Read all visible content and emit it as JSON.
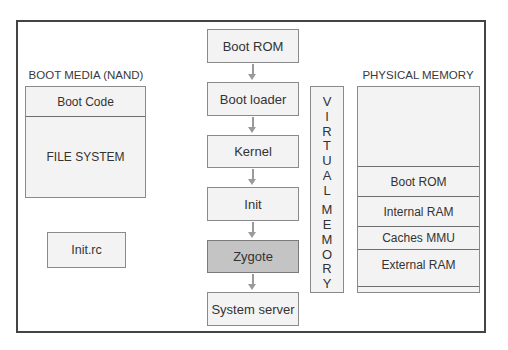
{
  "diagram": {
    "boot_media": {
      "title": "BOOT MEDIA (NAND)",
      "sections": [
        "Boot Code",
        "FILE SYSTEM"
      ]
    },
    "init_rc": {
      "label": "Init.rc"
    },
    "boot_sequence": {
      "steps": [
        "Boot ROM",
        "Boot loader",
        "Kernel",
        "Init",
        "Zygote",
        "System server"
      ],
      "highlighted_step": "Zygote"
    },
    "virtual_memory": {
      "letters_1": [
        "V",
        "I",
        "R",
        "T",
        "U",
        "A",
        "L"
      ],
      "letters_2": [
        "M",
        "E",
        "M",
        "O",
        "R",
        "Y"
      ],
      "label": "VIRTUAL MEMORY"
    },
    "physical_memory": {
      "title": "PHYSICAL MEMORY",
      "regions": [
        "",
        "Boot ROM",
        "Internal RAM",
        "Caches MMU",
        "External RAM",
        ""
      ]
    },
    "colors": {
      "frame": "#444444",
      "box_fill": "#f3f3f3",
      "highlight_fill": "#c4c4c4",
      "arrow": "#9a9a9a"
    }
  }
}
